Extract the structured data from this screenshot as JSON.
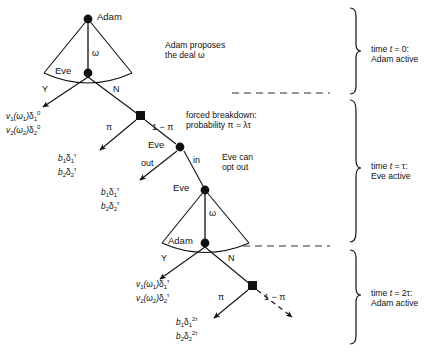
{
  "diagram": {
    "nodes": {
      "adam_t0": "Adam",
      "eve_t0": "Eve",
      "eve_tau_out": "Eve",
      "eve_tau_in": "Eve",
      "adam_2tau": "Adam"
    },
    "branch_labels": {
      "omega_top": "ω",
      "yes_top": "Y",
      "no_top": "N",
      "pi_top": "π",
      "one_minus_pi_top": "1 − π",
      "out": "out",
      "in": "in",
      "omega_bottom": "ω",
      "yes_bottom": "Y",
      "no_bottom": "N",
      "pi_bottom": "π",
      "one_minus_pi_bottom": "1 − π"
    },
    "payoffs": [
      {
        "name": "payoff-accept-t0",
        "line1": {
          "v": "v",
          "vsub": "1",
          "arg": "(ω",
          "argsub": "1",
          "argclose": ")",
          "d": "δ",
          "dsub": "1",
          "dsup": "0"
        },
        "line2": {
          "v": "v",
          "vsub": "2",
          "arg": "(ω",
          "argsub": "2",
          "argclose": ")",
          "d": "δ",
          "dsub": "2",
          "dsup": "0"
        }
      },
      {
        "name": "payoff-breakdown-t0",
        "line1": {
          "b": "b",
          "bsub": "1",
          "d": "δ",
          "dsub": "1",
          "dsup": "τ"
        },
        "line2": {
          "b": "b",
          "bsub": "2",
          "d": "δ",
          "dsub": "2",
          "dsup": "τ"
        }
      },
      {
        "name": "payoff-opt-out-tau",
        "line1": {
          "b": "b",
          "bsub": "1",
          "d": "δ",
          "dsub": "1",
          "dsup": "τ"
        },
        "line2": {
          "b": "b",
          "bsub": "2",
          "d": "δ",
          "dsub": "2",
          "dsup": "τ"
        }
      },
      {
        "name": "payoff-accept-2tau",
        "line1": {
          "v": "v",
          "vsub": "1",
          "arg": "(ω",
          "argsub": "1",
          "argclose": ")",
          "d": "δ",
          "dsub": "1",
          "dsup": "τ"
        },
        "line2": {
          "v": "v",
          "vsub": "2",
          "arg": "(ω",
          "argsub": "2",
          "argclose": ")",
          "d": "δ",
          "dsub": "2",
          "dsup": "τ"
        }
      },
      {
        "name": "payoff-breakdown-2tau",
        "line1": {
          "b": "b",
          "bsub": "1",
          "d": "δ",
          "dsub": "1",
          "dsup": "2τ"
        },
        "line2": {
          "b": "b",
          "bsub": "2",
          "d": "δ",
          "dsub": "2",
          "dsup": "2τ"
        }
      }
    ],
    "annotations": {
      "adam_proposes_line1": "Adam proposes",
      "adam_proposes_line2": "the deal ω",
      "forced_line1": "forced breakdown:",
      "forced_line2": "probability π = λτ",
      "eve_opt_line1": "Eve can",
      "eve_opt_line2": "opt out"
    },
    "timeline": [
      {
        "name": "time-bracket-t0",
        "line1_pre": "time ",
        "line1_it": "t",
        "line1_post": " = 0:",
        "line2": "Adam active"
      },
      {
        "name": "time-bracket-tau",
        "line1_pre": "time ",
        "line1_it": "t",
        "line1_post": " = τ:",
        "line2": "Eve active"
      },
      {
        "name": "time-bracket-2tau",
        "line1_pre": "time ",
        "line1_it": "t",
        "line1_post": " = 2τ:",
        "line2": "Adam active"
      }
    ],
    "colors": {
      "ink": "#111111",
      "background": "#ffffff",
      "dashed": "#555555"
    }
  }
}
